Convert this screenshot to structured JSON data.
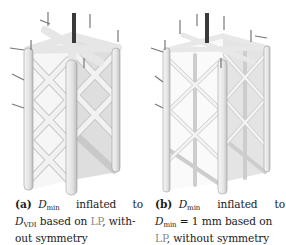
{
  "figure": {
    "subfigures": [
      {
        "id": "a",
        "label": "(a)",
        "caption": {
          "line1": {
            "symbol": "D",
            "subscript": "min",
            "w1": "inflated",
            "w2": "to"
          },
          "line2": {
            "symbol": "D",
            "subscript": "VDI",
            "text_before_link": " based on ",
            "link": "LP",
            "text_after_link": ", with-"
          },
          "line3": "out symmetry"
        },
        "image": {
          "description": "lattice structure, thick struts",
          "strut_color": "#ececec",
          "load_bar_color": "#3a3a3a"
        }
      },
      {
        "id": "b",
        "label": "(b)",
        "caption": {
          "line1": {
            "symbol": "D",
            "subscript": "min",
            "w1": "inflated",
            "w2": "to"
          },
          "line2": {
            "symbol": "D",
            "subscript": "min",
            "text_after": " = 1 mm based on"
          },
          "line3": {
            "link": "LP",
            "text_after_link": ", without symmetry"
          }
        },
        "image": {
          "description": "lattice structure, thin struts",
          "strut_color": "#efefef",
          "load_bar_color": "#3a3a3a"
        }
      }
    ]
  }
}
